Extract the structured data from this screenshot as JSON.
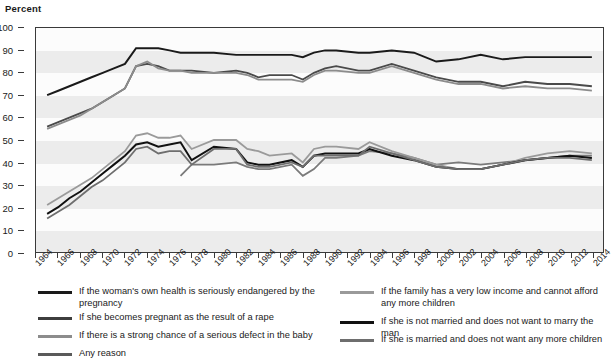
{
  "chart_data": {
    "type": "line",
    "title": "",
    "ylabel": "Percent",
    "xlabel": "",
    "ylim": [
      0,
      100
    ],
    "ytick_step": 10,
    "yticks": [
      0,
      10,
      20,
      30,
      40,
      50,
      60,
      70,
      80,
      90,
      100
    ],
    "xlim": [
      1964,
      2015
    ],
    "xticks": [
      1964,
      1966,
      1968,
      1970,
      1972,
      1974,
      1976,
      1978,
      1980,
      1982,
      1984,
      1986,
      1988,
      1990,
      1992,
      1994,
      1996,
      1998,
      2000,
      2002,
      2004,
      2006,
      2008,
      2010,
      2012,
      2014
    ],
    "grid": "horizontal-bands",
    "legend_position": "below",
    "series": [
      {
        "name": "If the woman's own health is seriously endangered by the pregnancy",
        "color": "#1a1a1a",
        "width": 2.0,
        "x": [
          1965,
          1966,
          1967,
          1968,
          1969,
          1970,
          1971,
          1972,
          1973,
          1974,
          1975,
          1976,
          1977,
          1978,
          1980,
          1982,
          1983,
          1984,
          1985,
          1987,
          1988,
          1989,
          1990,
          1991,
          1993,
          1994,
          1996,
          1998,
          2000,
          2002,
          2004,
          2006,
          2008,
          2010,
          2012,
          2014
        ],
        "values": [
          70,
          72,
          74,
          76,
          78,
          80,
          82,
          84,
          91,
          91,
          91,
          90,
          89,
          89,
          89,
          88,
          88,
          88,
          88,
          88,
          87,
          89,
          90,
          90,
          89,
          89,
          90,
          89,
          85,
          86,
          88,
          86,
          87,
          87,
          87,
          87
        ]
      },
      {
        "name": "If she becomes pregnant as the result of a rape",
        "color": "#4a4a4a",
        "width": 1.8,
        "x": [
          1965,
          1966,
          1967,
          1968,
          1969,
          1970,
          1971,
          1972,
          1973,
          1974,
          1975,
          1976,
          1977,
          1978,
          1980,
          1982,
          1983,
          1984,
          1985,
          1987,
          1988,
          1989,
          1990,
          1991,
          1993,
          1994,
          1996,
          1998,
          2000,
          2002,
          2004,
          2006,
          2008,
          2010,
          2012,
          2014
        ],
        "values": [
          56,
          58,
          60,
          62,
          64,
          67,
          70,
          73,
          83,
          84,
          83,
          81,
          81,
          81,
          80,
          81,
          80,
          78,
          79,
          79,
          77,
          80,
          82,
          83,
          81,
          81,
          84,
          81,
          78,
          76,
          76,
          74,
          76,
          75,
          75,
          74
        ]
      },
      {
        "name": "If there is a strong chance of a serious defect in the baby",
        "color": "#8c8c8c",
        "width": 1.8,
        "x": [
          1965,
          1966,
          1967,
          1968,
          1969,
          1970,
          1971,
          1972,
          1973,
          1974,
          1975,
          1976,
          1977,
          1978,
          1980,
          1982,
          1983,
          1984,
          1985,
          1987,
          1988,
          1989,
          1990,
          1991,
          1993,
          1994,
          1996,
          1998,
          2000,
          2002,
          2004,
          2006,
          2008,
          2010,
          2012,
          2014
        ],
        "values": [
          55,
          57,
          59,
          61,
          64,
          67,
          70,
          73,
          83,
          85,
          82,
          81,
          81,
          80,
          80,
          80,
          79,
          77,
          77,
          77,
          76,
          79,
          81,
          81,
          80,
          80,
          83,
          80,
          77,
          75,
          75,
          73,
          74,
          73,
          73,
          72
        ]
      },
      {
        "name": "Any reason",
        "color": "#7a7a7a",
        "width": 1.8,
        "x": [
          1977,
          1978,
          1980,
          1982,
          1983,
          1984,
          1985,
          1987,
          1988,
          1989,
          1990,
          1991,
          1993,
          1994,
          1996,
          1998,
          2000,
          2002,
          2004,
          2006,
          2008,
          2010,
          2012,
          2014
        ],
        "values": [
          34,
          39,
          39,
          40,
          38,
          37,
          37,
          39,
          34,
          37,
          42,
          42,
          43,
          45,
          44,
          42,
          39,
          40,
          39,
          40,
          41,
          42,
          43,
          43
        ]
      },
      {
        "name": "If the family has a very low income and cannot afford any more children",
        "color": "#9a9a9a",
        "width": 1.8,
        "x": [
          1965,
          1966,
          1967,
          1968,
          1969,
          1970,
          1971,
          1972,
          1973,
          1974,
          1975,
          1976,
          1977,
          1978,
          1980,
          1982,
          1983,
          1984,
          1985,
          1987,
          1988,
          1989,
          1990,
          1991,
          1993,
          1994,
          1996,
          1998,
          2000,
          2002,
          2004,
          2006,
          2008,
          2010,
          2012,
          2014
        ],
        "values": [
          21,
          24,
          27,
          30,
          33,
          37,
          41,
          45,
          52,
          53,
          51,
          51,
          52,
          46,
          50,
          50,
          46,
          45,
          43,
          44,
          40,
          46,
          47,
          47,
          46,
          49,
          45,
          42,
          39,
          37,
          37,
          39,
          42,
          44,
          45,
          44
        ]
      },
      {
        "name": "If she is not married and does not want to marry the man",
        "color": "#111111",
        "width": 2.0,
        "x": [
          1965,
          1966,
          1967,
          1968,
          1969,
          1970,
          1971,
          1972,
          1973,
          1974,
          1975,
          1976,
          1977,
          1978,
          1980,
          1982,
          1983,
          1984,
          1985,
          1987,
          1988,
          1989,
          1990,
          1991,
          1993,
          1994,
          1996,
          1998,
          2000,
          2002,
          2004,
          2006,
          2008,
          2010,
          2012,
          2014
        ],
        "values": [
          17,
          20,
          24,
          27,
          31,
          35,
          39,
          43,
          48,
          49,
          47,
          48,
          49,
          41,
          47,
          46,
          40,
          39,
          39,
          41,
          38,
          43,
          44,
          44,
          44,
          46,
          43,
          41,
          38,
          37,
          37,
          39,
          41,
          42,
          43,
          42
        ]
      },
      {
        "name": "If she is married and does not want any more children",
        "color": "#6e6e6e",
        "width": 1.8,
        "x": [
          1965,
          1966,
          1967,
          1968,
          1969,
          1970,
          1971,
          1972,
          1973,
          1974,
          1975,
          1976,
          1977,
          1978,
          1980,
          1982,
          1983,
          1984,
          1985,
          1987,
          1988,
          1989,
          1990,
          1991,
          1993,
          1994,
          1996,
          1998,
          2000,
          2002,
          2004,
          2006,
          2008,
          2010,
          2012,
          2014
        ],
        "values": [
          15,
          18,
          21,
          25,
          29,
          32,
          36,
          40,
          46,
          47,
          44,
          45,
          45,
          39,
          46,
          46,
          39,
          38,
          38,
          40,
          38,
          43,
          43,
          43,
          43,
          47,
          44,
          41,
          38,
          37,
          37,
          39,
          41,
          42,
          42,
          41
        ]
      }
    ]
  },
  "legend": {
    "left_entries": [
      {
        "label": "If the woman's own health is seriously endangered by the pregnancy",
        "color": "#1a1a1a"
      },
      {
        "label": "If she becomes pregnant as the result of a rape",
        "color": "#3d3d3d"
      },
      {
        "label": "If there is a strong chance of a serious defect in the baby",
        "color": "#8c8c8c"
      },
      {
        "label": "Any reason",
        "color": "#5a5a5a"
      }
    ],
    "right_entries": [
      {
        "label": "If the family has a very low income and cannot afford any more children",
        "color": "#9a9a9a"
      },
      {
        "label": "If she is not married and does not want to marry the man",
        "color": "#111111"
      },
      {
        "label": "If she is married and does not want any more children",
        "color": "#6e6e6e"
      }
    ]
  }
}
